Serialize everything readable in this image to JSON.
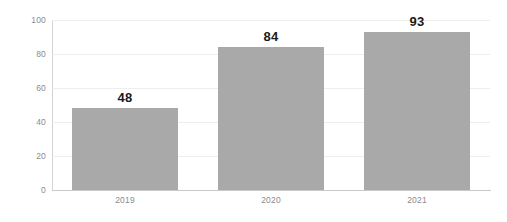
{
  "chart_data": {
    "type": "bar",
    "title": "",
    "subtitle": "",
    "xlabel": "",
    "ylabel": "",
    "categories": [
      "2019",
      "2020",
      "2021"
    ],
    "values": [
      48,
      84,
      93
    ],
    "data_labels": [
      "48",
      "84",
      "93"
    ],
    "ylim": [
      0,
      100
    ],
    "yticks": [
      0,
      20,
      40,
      60,
      80,
      100
    ],
    "ytick_labels": [
      "0",
      "20",
      "40",
      "60",
      "80",
      "100"
    ],
    "grid": "horizontal",
    "legend": "none",
    "series": [
      {
        "name": "",
        "values": [
          48,
          84,
          93
        ]
      }
    ],
    "colors": {
      "bar": "#a9a9a9",
      "gridline": "#eeeeee",
      "axis": "#c9c9c9",
      "tick_text": "#8c8c8c",
      "value_text": "#1a1a1a",
      "background": "#ffffff"
    }
  }
}
